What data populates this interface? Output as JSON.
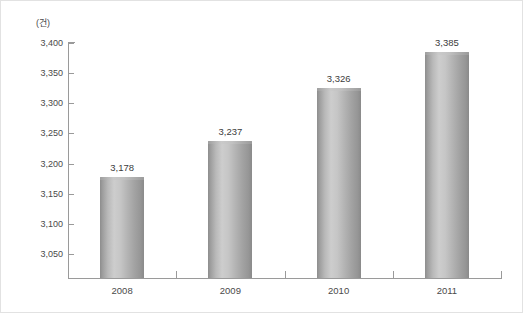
{
  "chart_data": {
    "type": "bar",
    "title": "",
    "subtitle": "",
    "unit_label": "(건)",
    "xlabel": "",
    "ylabel": "",
    "categories": [
      "2008",
      "2009",
      "2010",
      "2011"
    ],
    "values": [
      3178,
      3237,
      3326,
      3385
    ],
    "value_labels": [
      "3,178",
      "3,237",
      "3,326",
      "3,385"
    ],
    "series": [
      {
        "name": "",
        "values": [
          3178,
          3237,
          3326,
          3385
        ]
      }
    ],
    "ylim": [
      3010,
      3400
    ],
    "ytick_values": [
      3050,
      3100,
      3150,
      3200,
      3250,
      3300,
      3350,
      3400
    ],
    "ytick_labels": [
      "3,050",
      "3,100",
      "3,150",
      "3,200",
      "3,250",
      "3,300",
      "3,350",
      "3,400"
    ],
    "grid": false,
    "legend": null,
    "legend_position": "none",
    "bar_style": "cylinder",
    "colors": {
      "bar_light": "#cdcdcd",
      "bar_mid": "#b4b4b4",
      "bar_dark": "#8a8a8a",
      "axis": "#9a9a9a",
      "text": "#4a4a4a",
      "value_text": "#3c3c3c",
      "background": "#ffffff",
      "border": "#e2e2e2"
    }
  }
}
